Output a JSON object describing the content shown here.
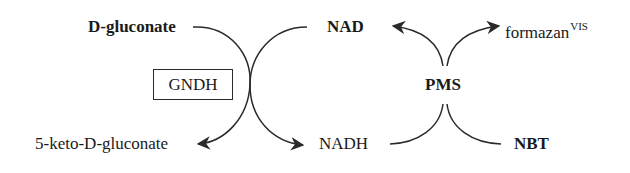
{
  "diagram": {
    "type": "coupled-redox-reaction-scheme",
    "enzyme": "GNDH",
    "left_cycle": {
      "substrate": {
        "prefix": "D",
        "rest": "-gluconate"
      },
      "product": {
        "before": "5-keto-",
        "prefix": "D",
        "rest": "-gluconate"
      },
      "cofactor_in": "NAD",
      "cofactor_out": "NADH"
    },
    "right_cycle": {
      "mediator": "PMS",
      "reduced_in": "NADH",
      "oxidized_out": "NAD",
      "dye_in": "NBT",
      "dye_out": {
        "name": "formazan",
        "superscript": "VIS"
      }
    },
    "colors": {
      "text": "#1a1a1a",
      "lines": "#2a2a2a",
      "background": "#ffffff"
    }
  }
}
